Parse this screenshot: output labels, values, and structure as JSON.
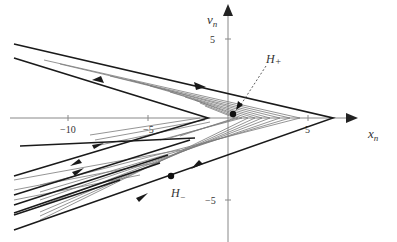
{
  "figure": {
    "type": "phase-portrait",
    "x_axis": {
      "label": "x",
      "label_subscript": "n",
      "ticks": [
        {
          "value": -10,
          "label": "−10"
        },
        {
          "value": -5,
          "label": "−5"
        },
        {
          "value": 5,
          "label": "5"
        }
      ],
      "range": [
        -13.5,
        8
      ]
    },
    "y_axis": {
      "label": "v",
      "label_subscript": "n",
      "ticks": [
        {
          "value": 5,
          "label": "5"
        },
        {
          "value": -5,
          "label": "−5"
        }
      ],
      "range": [
        -7.5,
        7.2
      ]
    },
    "points": [
      {
        "name": "H+",
        "label": "H",
        "sub": "+",
        "x": 0.3,
        "y": 0.25
      },
      {
        "name": "H-",
        "label": "H",
        "sub": "−",
        "x": -3.5,
        "y": -3.6
      }
    ],
    "trajectories": {
      "outer_vertex_x": 6.5,
      "description": "V-shaped orbits converging toward vertices on the x-axis, spiralling trajectories with arrows"
    },
    "colors": {
      "thick_line": "#1a1a1a",
      "thin_line": "#7a7a7a",
      "axis": "#888888"
    }
  }
}
